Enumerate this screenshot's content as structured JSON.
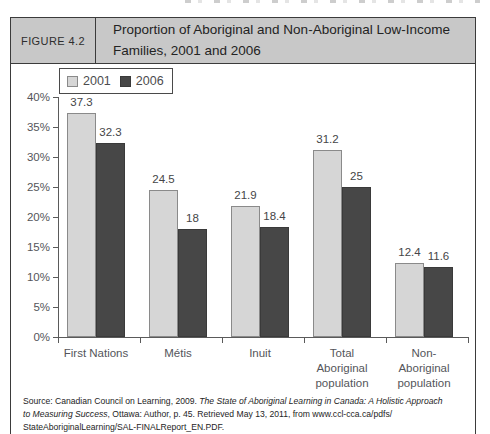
{
  "figure": {
    "label": "FIGURE 4.2",
    "title": "Proportion of Aboriginal and Non-Aboriginal Low-Income\nFamilies, 2001 and 2006",
    "header_bg": "#c8c8c8",
    "border_color": "#3b3b3b"
  },
  "chart_data": {
    "type": "bar",
    "title": "Proportion of Aboriginal and Non-Aboriginal Low-Income Families, 2001 and 2006",
    "categories": [
      "First Nations",
      "Métis",
      "Inuit",
      "Total Aboriginal population",
      "Non-Aboriginal population"
    ],
    "category_labels": [
      "First Nations",
      "Métis",
      "Inuit",
      "Total\nAboriginal\npopulation",
      "Non-Aboriginal\npopulation"
    ],
    "series": [
      {
        "name": "2001",
        "values": [
          37.3,
          24.5,
          21.9,
          31.2,
          12.4
        ],
        "color": "#d6d6d6",
        "border": "#8a8a8a"
      },
      {
        "name": "2006",
        "values": [
          32.3,
          18,
          18.4,
          25,
          11.6
        ],
        "color": "#474747",
        "border": "#3a3a3a"
      }
    ],
    "xlabel": "",
    "ylabel": "",
    "ylim": [
      0,
      40
    ],
    "ytick_step": 5,
    "ytick_suffix": "%",
    "grid": false,
    "legend_position": "top-left",
    "value_labels": true
  },
  "source": {
    "line1_regular": "Source: Canadian Council on Learning, 2009. ",
    "line1_italic": "The State of Aboriginal Learning in Canada: A Holistic Approach",
    "line2_italic": "to Measuring Success",
    "line2_regular": ", Ottawa: Author, p. 45. Retrieved May 13, 2011, from www.ccl-cca.ca/pdfs/",
    "line3_regular": "StateAboriginalLearning/SAL-FINALReport_EN.PDF."
  }
}
